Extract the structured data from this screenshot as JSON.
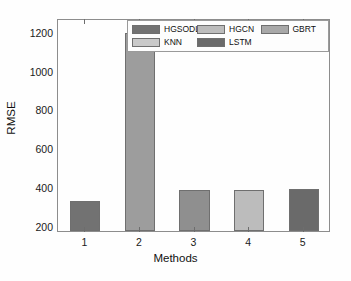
{
  "chart_data": {
    "type": "bar",
    "title": "",
    "xlabel": "Methods",
    "ylabel": "RMSE",
    "categories": [
      "1",
      "2",
      "3",
      "4",
      "5"
    ],
    "values": [
      330,
      1195,
      385,
      388,
      390
    ],
    "series": [
      {
        "name": "HGSODL-TFF",
        "categories": [
          "1",
          "2",
          "3",
          "4",
          "5"
        ],
        "values": [
          330,
          1195,
          385,
          388,
          390
        ]
      }
    ],
    "ylim": [
      175,
      1270
    ],
    "yticks": [
      200,
      400,
      600,
      800,
      1000,
      1200
    ],
    "ytick_labels": [
      "200",
      "400",
      "600",
      "800",
      "1000",
      "1200"
    ],
    "xticks": [
      1,
      2,
      3,
      4,
      5
    ],
    "xtick_labels": [
      "1",
      "2",
      "3",
      "4",
      "5"
    ],
    "grid": false,
    "legend_position": "upper-center",
    "bar_colors": [
      "#727272",
      "#9d9d9d",
      "#8f8f8f",
      "#bcbcbc",
      "#6a6a6a"
    ],
    "legend": [
      {
        "label": "HGSODL-TFF",
        "color": "#727272"
      },
      {
        "label": "HGCN",
        "color": "#bcbcbc"
      },
      {
        "label": "GBRT",
        "color": "#a8a8a8"
      },
      {
        "label": "KNN",
        "color": "#c9c9c9"
      },
      {
        "label": "LSTM",
        "color": "#6a6a6a"
      }
    ],
    "legend_rows": [
      [
        {
          "label": "HGSODL-TFF",
          "color": "#727272"
        },
        {
          "label": "HGCN",
          "color": "#bcbcbc"
        },
        {
          "label": "GBRT",
          "color": "#a8a8a8"
        }
      ],
      [
        {
          "label": "KNN",
          "color": "#c9c9c9"
        },
        {
          "label": "LSTM",
          "color": "#6a6a6a"
        }
      ]
    ],
    "axis_color": "#8d8d8d",
    "background": "#ffffff"
  }
}
